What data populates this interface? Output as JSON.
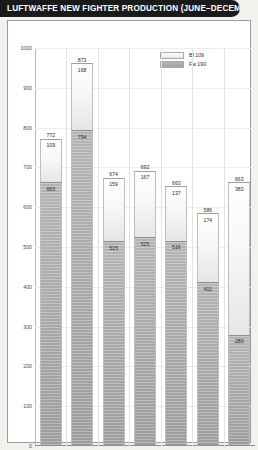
{
  "header": {
    "title": "LUFTWAFFE NEW FIGHTER PRODUCTION (JUNE–DECEMBER 1943)"
  },
  "legend": {
    "position": "top-right",
    "items": [
      {
        "label": "Bf 109",
        "swatch": "light"
      },
      {
        "label": "Fw 190",
        "swatch": "dark"
      }
    ]
  },
  "chart_data": {
    "type": "bar",
    "subtype": "stacked",
    "title": "LUFTWAFFE NEW FIGHTER PRODUCTION (JUNE–DECEMBER 1943)",
    "xlabel": "",
    "ylabel": "",
    "ylim": [
      0,
      1000
    ],
    "yticks": [
      0,
      100,
      200,
      300,
      400,
      500,
      600,
      700,
      800,
      900,
      1000
    ],
    "ytick_labels": [
      "0",
      "100",
      "200",
      "300",
      "400",
      "500",
      "600",
      "700",
      "800",
      "900",
      "1000"
    ],
    "grid": true,
    "categories": [
      "June",
      "July",
      "August",
      "September",
      "October",
      "November",
      "December"
    ],
    "series": [
      {
        "name": "Bf 109",
        "values": [
          663,
          794,
          515,
          525,
          516,
          411,
          280
        ]
      },
      {
        "name": "Fw 190",
        "values": [
          109,
          168,
          159,
          167,
          137,
          174,
          383
        ]
      }
    ],
    "totals": [
      772,
      873,
      674,
      692,
      663,
      586,
      663
    ],
    "total_labels": [
      "772",
      "873",
      "674",
      "692",
      "663",
      "586",
      "663"
    ],
    "top_segment_labels": [
      "109",
      "168",
      "159",
      "167",
      "137",
      "174",
      "383"
    ],
    "bottom_segment_labels": [
      "663",
      "794",
      "515",
      "525",
      "516",
      "411",
      "280"
    ]
  },
  "colors": {
    "title_bar": "#1a1a1a",
    "title_text": "#ffffff",
    "page_background": "#f2f1ee",
    "plot_background": "#ffffff",
    "segment_light": "#f4f4f4",
    "segment_dark": "#a9a9a9",
    "grid": "#ededed",
    "axis": "#8c8c8c"
  }
}
